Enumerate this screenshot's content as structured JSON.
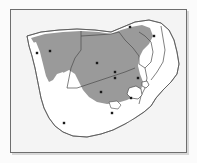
{
  "figure": {
    "kind": "distribution-map",
    "region": "Southern Africa",
    "frame": {
      "x": 10,
      "y": 9,
      "width": 177,
      "height": 144
    }
  },
  "legend": {
    "shaded_meaning": "Shaded distribution range",
    "dot_meaning": "Recorded locality"
  },
  "colors": {
    "page_background": "#fbfbfb",
    "frame_stroke": "#6e6e6e",
    "land_fill": "#ffffff",
    "sea_fill": "#f4f4f4",
    "range_fill": "#9a9a9a",
    "coastline_stroke": "#555555",
    "border_stroke": "#4a4a4a",
    "dot_fill": "#1a1a1a",
    "shadow": "#d8d8d8"
  },
  "map_data": {
    "type": "choropleth-range-with-points",
    "projection": "unprojected outline",
    "shaded_range_label": "Species distribution range",
    "localities": [
      {
        "id": "loc-1",
        "x": 37,
        "y": 53
      },
      {
        "id": "loc-2",
        "x": 50,
        "y": 51
      },
      {
        "id": "loc-3",
        "x": 130,
        "y": 27
      },
      {
        "id": "loc-4",
        "x": 154,
        "y": 36
      },
      {
        "id": "loc-5",
        "x": 97,
        "y": 63
      },
      {
        "id": "loc-6",
        "x": 115,
        "y": 72
      },
      {
        "id": "loc-7",
        "x": 115,
        "y": 78
      },
      {
        "id": "loc-8",
        "x": 138,
        "y": 78
      },
      {
        "id": "loc-9",
        "x": 101,
        "y": 92
      },
      {
        "id": "loc-10",
        "x": 131,
        "y": 98
      },
      {
        "id": "loc-11",
        "x": 112,
        "y": 113
      },
      {
        "id": "loc-12",
        "x": 64,
        "y": 123
      }
    ],
    "locality_count": 12,
    "enclave_label": "Lesotho",
    "countries_outlined": [
      "Namibia",
      "Botswana",
      "Zimbabwe",
      "Mozambique",
      "South Africa",
      "Lesotho",
      "Swaziland"
    ]
  }
}
